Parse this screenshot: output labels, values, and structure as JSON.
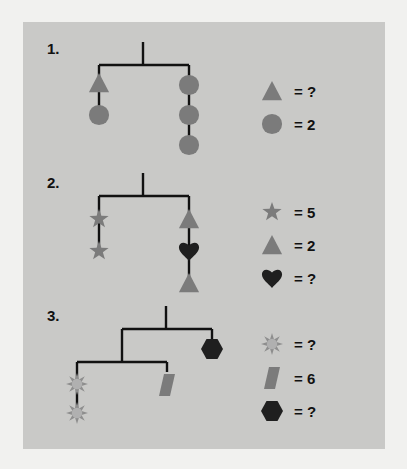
{
  "colors": {
    "background": "#f1f1ef",
    "panel": "#c9c9c7",
    "gray_shape": "#7b7b7b",
    "dark_shape": "#1f1f1f",
    "sun_shape": "#a9a9a9",
    "string": "#111111"
  },
  "problems": [
    {
      "label": "1.",
      "legend": [
        {
          "shape": "triangle-icon",
          "value": "= ?"
        },
        {
          "shape": "circle-icon",
          "value": "= 2"
        }
      ]
    },
    {
      "label": "2.",
      "legend": [
        {
          "shape": "star-icon",
          "value": "= 5"
        },
        {
          "shape": "triangle-icon",
          "value": "= 2"
        },
        {
          "shape": "heart-icon",
          "value": "= ?"
        }
      ]
    },
    {
      "label": "3.",
      "legend": [
        {
          "shape": "sun-icon",
          "value": "= ?"
        },
        {
          "shape": "parallelogram-icon",
          "value": "= 6"
        },
        {
          "shape": "hexagon-icon",
          "value": "= ?"
        }
      ]
    }
  ]
}
